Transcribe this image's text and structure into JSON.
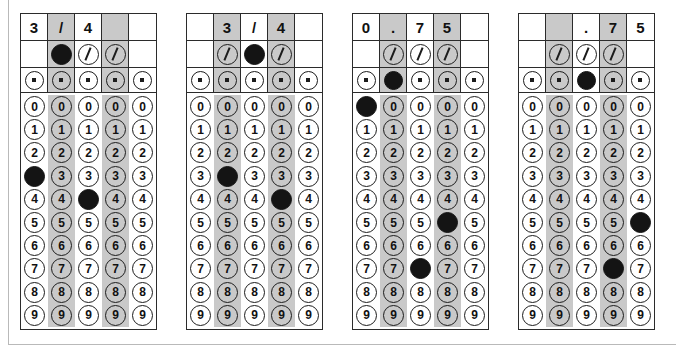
{
  "page": {
    "frame_color": "#b9b9b9",
    "ink_color": "#141414",
    "shade_color": "#c9c9c9"
  },
  "symbols": {
    "slash": "/",
    "decimal": ".",
    "blank": ""
  },
  "digit_labels": [
    "0",
    "1",
    "2",
    "3",
    "4",
    "5",
    "6",
    "7",
    "8",
    "9"
  ],
  "grids": [
    {
      "name": "grid-1",
      "answer_text": "3/4",
      "header": [
        "3",
        "/",
        "4",
        "",
        ""
      ],
      "shaded_columns": [
        1,
        3
      ],
      "slash_row": {
        "present": [
          false,
          true,
          true,
          true,
          false
        ],
        "filled": [
          false,
          true,
          false,
          false,
          false
        ]
      },
      "decimal_row": {
        "present": [
          true,
          true,
          true,
          true,
          true
        ],
        "filled": [
          false,
          false,
          false,
          false,
          false
        ]
      },
      "marked_digits": [
        3,
        null,
        4,
        null,
        null
      ]
    },
    {
      "name": "grid-2",
      "answer_text": "3/4",
      "header": [
        "",
        "3",
        "/",
        "4",
        ""
      ],
      "shaded_columns": [
        1,
        3
      ],
      "slash_row": {
        "present": [
          false,
          true,
          true,
          true,
          false
        ],
        "filled": [
          false,
          false,
          true,
          false,
          false
        ]
      },
      "decimal_row": {
        "present": [
          true,
          true,
          true,
          true,
          true
        ],
        "filled": [
          false,
          false,
          false,
          false,
          false
        ]
      },
      "marked_digits": [
        null,
        3,
        null,
        4,
        null
      ]
    },
    {
      "name": "grid-3",
      "answer_text": "0.75",
      "header": [
        "0",
        ".",
        "7",
        "5",
        ""
      ],
      "shaded_columns": [
        1,
        3
      ],
      "slash_row": {
        "present": [
          false,
          true,
          true,
          true,
          false
        ],
        "filled": [
          false,
          false,
          false,
          false,
          false
        ]
      },
      "decimal_row": {
        "present": [
          true,
          true,
          true,
          true,
          true
        ],
        "filled": [
          false,
          true,
          false,
          false,
          false
        ]
      },
      "marked_digits": [
        0,
        null,
        7,
        5,
        null
      ]
    },
    {
      "name": "grid-4",
      "answer_text": ".75",
      "header": [
        "",
        "",
        ".",
        "7",
        "5"
      ],
      "shaded_columns": [
        1,
        3
      ],
      "slash_row": {
        "present": [
          false,
          true,
          true,
          true,
          false
        ],
        "filled": [
          false,
          false,
          false,
          false,
          false
        ]
      },
      "decimal_row": {
        "present": [
          true,
          true,
          true,
          true,
          true
        ],
        "filled": [
          false,
          false,
          true,
          false,
          false
        ]
      },
      "marked_digits": [
        null,
        null,
        null,
        7,
        5
      ]
    }
  ]
}
